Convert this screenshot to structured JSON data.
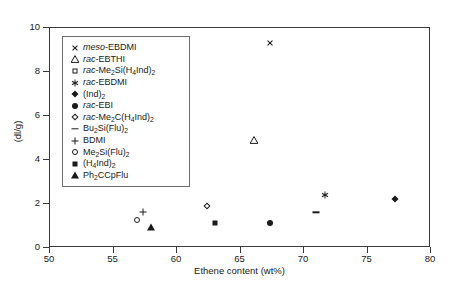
{
  "chart_data": {
    "type": "scatter",
    "title": "",
    "xlabel": "Ethene content (wt%)",
    "ylabel": "(dl/g)",
    "xlim": [
      50,
      80
    ],
    "ylim": [
      0,
      10
    ],
    "xticks": [
      50,
      55,
      60,
      65,
      70,
      75,
      80
    ],
    "yticks": [
      0,
      2,
      4,
      6,
      8,
      10
    ],
    "grid": false,
    "legend_position": "upper-left-inside",
    "series": [
      {
        "name": "meso-EBDMI",
        "marker": "cross",
        "x": [
          67.4
        ],
        "y": [
          9.3
        ]
      },
      {
        "name": "rac-EBTHI",
        "marker": "triangle-open",
        "x": [
          66.1
        ],
        "y": [
          4.9
        ]
      },
      {
        "name": "rac-Me2Si(H4Ind)2",
        "marker": "square-open",
        "x": [
          59.9
        ],
        "y": [
          4.1
        ]
      },
      {
        "name": "rac-EBDMI",
        "marker": "asterisk",
        "x": [
          71.7
        ],
        "y": [
          2.4
        ]
      },
      {
        "name": "(Ind)2",
        "marker": "diamond-filled",
        "x": [
          77.2
        ],
        "y": [
          2.2
        ]
      },
      {
        "name": "rac-EBI",
        "marker": "circle-filled",
        "x": [
          67.4
        ],
        "y": [
          1.1
        ]
      },
      {
        "name": "rac-Me2C(H4Ind)2",
        "marker": "diamond-open",
        "x": [
          62.4
        ],
        "y": [
          1.9
        ]
      },
      {
        "name": "Bu2Si(Flu)2",
        "marker": "dash",
        "x": [
          71.0
        ],
        "y": [
          1.6
        ]
      },
      {
        "name": "BDMI",
        "marker": "plus",
        "x": [
          57.4
        ],
        "y": [
          1.6
        ]
      },
      {
        "name": "Me2Si(Flu)2",
        "marker": "circle-open",
        "x": [
          56.9
        ],
        "y": [
          1.25
        ]
      },
      {
        "name": "(H4Ind)2",
        "marker": "square-filled",
        "x": [
          63.0
        ],
        "y": [
          1.1
        ]
      },
      {
        "name": "Ph2CCpFlu",
        "marker": "triangle-filled",
        "x": [
          58.0
        ],
        "y": [
          0.95
        ]
      }
    ]
  },
  "axes": {
    "y_title": "(dl/g)",
    "x_title": "Ethene content (wt%)",
    "y_tick_labels": [
      "10",
      "8",
      "6",
      "4",
      "2",
      "0"
    ],
    "x_tick_labels": [
      "50",
      "55",
      "60",
      "65",
      "70",
      "75",
      "80"
    ]
  },
  "legend": {
    "entries": [
      {
        "italic": "meso",
        "rest": "-EBDMI",
        "marker": "cross"
      },
      {
        "italic": "rac",
        "rest": "-EBTHI",
        "marker": "triangle-open"
      },
      {
        "italic": "rac",
        "rest": "-Me2Si(H4Ind)2",
        "marker": "square-open"
      },
      {
        "italic": "rac",
        "rest": "-EBDMI",
        "marker": "asterisk"
      },
      {
        "italic": "",
        "rest": "(Ind)2",
        "marker": "diamond-filled"
      },
      {
        "italic": "rac",
        "rest": "-EBI",
        "marker": "circle-filled"
      },
      {
        "italic": "rac",
        "rest": "-Me2C(H4Ind)2",
        "marker": "diamond-open"
      },
      {
        "italic": "",
        "rest": "Bu2Si(Flu)2",
        "marker": "dash"
      },
      {
        "italic": "",
        "rest": "BDMI",
        "marker": "plus"
      },
      {
        "italic": "",
        "rest": "Me2Si(Flu)2",
        "marker": "circle-open"
      },
      {
        "italic": "",
        "rest": "(H4Ind)2",
        "marker": "square-filled"
      },
      {
        "italic": "",
        "rest": "Ph2CCpFlu",
        "marker": "triangle-filled"
      }
    ]
  },
  "colors": {
    "ink": "#1a1a1a",
    "frame": "#3a3a3a",
    "legend_border": "#6e6e6e",
    "background": "#ffffff"
  }
}
